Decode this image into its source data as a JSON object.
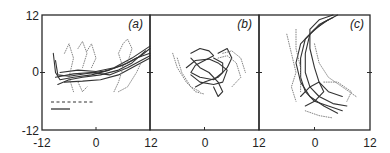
{
  "chart_data": [
    {
      "type": "line",
      "panel_label": "(a)",
      "xlim": [
        -12,
        12
      ],
      "ylim": [
        -12,
        12
      ],
      "x_ticks": [
        "-12",
        "0",
        "12"
      ],
      "y_ticks": [
        "12",
        "0",
        "-12"
      ],
      "legend": [
        {
          "style": "dashed",
          "label": ""
        },
        {
          "style": "solid",
          "label": ""
        }
      ],
      "series": [
        {
          "name": "solid trajectories",
          "style": "solid",
          "paths": [
            [
              [
                -9.5,
                4
              ],
              [
                -9,
                0
              ],
              [
                -8,
                -1.5
              ],
              [
                -5,
                -1
              ],
              [
                -1,
                -0.5
              ],
              [
                3,
                0.5
              ],
              [
                7,
                2
              ],
              [
                10,
                3.5
              ],
              [
                12,
                5
              ]
            ],
            [
              [
                -9,
                2.5
              ],
              [
                -8.5,
                -0.5
              ],
              [
                -6,
                -0.8
              ],
              [
                -2,
                -0.2
              ],
              [
                2,
                0.3
              ],
              [
                6,
                1.5
              ],
              [
                9,
                3
              ],
              [
                12,
                4
              ]
            ],
            [
              [
                -8.5,
                -2.5
              ],
              [
                -6,
                -1.5
              ],
              [
                -3,
                -1
              ],
              [
                1,
                -0.5
              ],
              [
                5,
                0.5
              ],
              [
                8,
                2
              ],
              [
                11,
                4.5
              ]
            ],
            [
              [
                -8,
                0
              ],
              [
                -4,
                0.5
              ],
              [
                0,
                0.2
              ],
              [
                4,
                1
              ],
              [
                8,
                3
              ],
              [
                12,
                5.5
              ]
            ],
            [
              [
                -9,
                -1
              ],
              [
                -5,
                -0.3
              ],
              [
                -1,
                0
              ],
              [
                3,
                -0.5
              ],
              [
                7,
                1
              ],
              [
                10,
                2.5
              ],
              [
                12,
                3.5
              ]
            ],
            [
              [
                -7,
                -2
              ],
              [
                -3,
                -1.8
              ],
              [
                1,
                -1.5
              ],
              [
                5,
                -0.5
              ],
              [
                9,
                1.5
              ],
              [
                12,
                3
              ]
            ]
          ]
        },
        {
          "name": "dotted trajectories",
          "style": "dotted",
          "paths": [
            [
              [
                -7,
                4
              ],
              [
                -6,
                6
              ],
              [
                -5,
                3
              ],
              [
                -6,
                -1
              ],
              [
                -5,
                -4
              ]
            ],
            [
              [
                -4,
                5
              ],
              [
                -3,
                6.5
              ],
              [
                -2,
                4
              ],
              [
                -3,
                1
              ]
            ],
            [
              [
                -2,
                4.5
              ],
              [
                -1,
                6
              ],
              [
                0,
                3
              ],
              [
                -1,
                1
              ]
            ],
            [
              [
                -4,
                -2
              ],
              [
                -3,
                -4
              ],
              [
                -2,
                -3
              ]
            ],
            [
              [
                4,
                -4
              ],
              [
                5,
                -2
              ],
              [
                6,
                1
              ],
              [
                5,
                4
              ],
              [
                6,
                6
              ],
              [
                7,
                7
              ],
              [
                8,
                5
              ],
              [
                7,
                2
              ]
            ],
            [
              [
                5,
                -4
              ],
              [
                7,
                -3
              ],
              [
                9,
                0
              ],
              [
                10,
                2
              ]
            ]
          ]
        }
      ]
    },
    {
      "type": "line",
      "panel_label": "(b)",
      "xlim": [
        -12,
        12
      ],
      "ylim": [
        -12,
        12
      ],
      "x_ticks": [
        "0",
        "12"
      ],
      "series": [
        {
          "name": "solid trajectories",
          "style": "solid",
          "paths": [
            [
              [
                -3,
                4
              ],
              [
                -1,
                5
              ],
              [
                1,
                4.5
              ],
              [
                2,
                3.5
              ],
              [
                0,
                2.5
              ],
              [
                -2,
                1.5
              ],
              [
                -3,
                0
              ],
              [
                -1,
                -1
              ],
              [
                2,
                -1.5
              ],
              [
                4,
                0
              ],
              [
                4,
                2
              ],
              [
                2,
                3
              ]
            ],
            [
              [
                -4,
                1
              ],
              [
                -2,
                2.5
              ],
              [
                1,
                2.8
              ],
              [
                3,
                2
              ],
              [
                5,
                0.5
              ],
              [
                4,
                -2
              ],
              [
                2,
                -2.5
              ],
              [
                -1,
                -2
              ],
              [
                -3,
                -0.5
              ]
            ],
            [
              [
                -2,
                -3
              ],
              [
                0,
                -2
              ],
              [
                3,
                -1
              ],
              [
                5,
                1
              ],
              [
                6,
                3
              ],
              [
                5,
                5
              ],
              [
                3,
                4
              ]
            ],
            [
              [
                -3,
                3
              ],
              [
                -1,
                1
              ],
              [
                1,
                0
              ],
              [
                3,
                -2
              ],
              [
                4,
                -4
              ],
              [
                3,
                -5
              ],
              [
                2,
                -3
              ]
            ]
          ]
        },
        {
          "name": "dotted trajectories",
          "style": "dotted",
          "paths": [
            [
              [
                -7,
                4
              ],
              [
                -6,
                1
              ],
              [
                -4,
                -2
              ],
              [
                -2,
                -4
              ],
              [
                0,
                -4.5
              ]
            ],
            [
              [
                -6,
                3
              ],
              [
                -5,
                0
              ],
              [
                -3,
                -3
              ],
              [
                -1,
                -4
              ]
            ],
            [
              [
                3,
                3
              ],
              [
                5,
                3.5
              ],
              [
                7,
                2
              ],
              [
                8,
                -1
              ],
              [
                6,
                -3
              ]
            ],
            [
              [
                4,
                4
              ],
              [
                6,
                4.5
              ],
              [
                8,
                3
              ],
              [
                9,
                0
              ]
            ]
          ]
        }
      ]
    },
    {
      "type": "line",
      "panel_label": "(c)",
      "xlim": [
        -12,
        12
      ],
      "ylim": [
        -12,
        12
      ],
      "x_ticks": [
        "0",
        "12"
      ],
      "series": [
        {
          "name": "solid trajectories",
          "style": "solid",
          "paths": [
            [
              [
                4,
                11.5
              ],
              [
                1,
                10
              ],
              [
                -2,
                7
              ],
              [
                -3,
                3
              ],
              [
                -3,
                -1
              ],
              [
                -2,
                -4
              ],
              [
                0,
                -6
              ],
              [
                3,
                -7
              ],
              [
                6,
                -8
              ]
            ],
            [
              [
                5,
                12
              ],
              [
                2,
                10.5
              ],
              [
                -1,
                8
              ],
              [
                -2,
                4
              ],
              [
                -2,
                0
              ],
              [
                -1,
                -3
              ],
              [
                1,
                -5
              ],
              [
                4,
                -6.5
              ],
              [
                7,
                -7
              ]
            ],
            [
              [
                3,
                11
              ],
              [
                0,
                9
              ],
              [
                -3,
                6
              ],
              [
                -4,
                2
              ],
              [
                -3,
                -2
              ],
              [
                -1,
                -5
              ],
              [
                2,
                -7
              ],
              [
                5,
                -8.5
              ]
            ],
            [
              [
                4,
                12
              ],
              [
                1,
                11
              ],
              [
                -1,
                9
              ],
              [
                -1,
                5
              ],
              [
                0,
                1
              ],
              [
                1,
                -2
              ],
              [
                3,
                -4
              ],
              [
                6,
                -5
              ]
            ],
            [
              [
                -3,
                -5
              ],
              [
                -1,
                -3
              ],
              [
                1,
                -2
              ],
              [
                2,
                -4
              ],
              [
                0,
                -6
              ],
              [
                -2,
                -7
              ]
            ]
          ]
        },
        {
          "name": "dotted trajectories",
          "style": "dotted",
          "paths": [
            [
              [
                -6,
                8
              ],
              [
                -5,
                4
              ],
              [
                -4,
                0
              ],
              [
                -5,
                -3
              ],
              [
                -4,
                -6
              ]
            ],
            [
              [
                -4,
                9
              ],
              [
                -4,
                5
              ],
              [
                -3,
                1
              ],
              [
                -3,
                -4
              ]
            ],
            [
              [
                0,
                6
              ],
              [
                1,
                2
              ],
              [
                3,
                -1
              ],
              [
                6,
                -3
              ],
              [
                9,
                -5
              ]
            ],
            [
              [
                2,
                -2
              ],
              [
                5,
                -2
              ],
              [
                8,
                -4
              ],
              [
                7,
                -6
              ]
            ],
            [
              [
                -2,
                -8
              ],
              [
                1,
                -9
              ],
              [
                4,
                -9.5
              ]
            ]
          ]
        }
      ]
    }
  ],
  "axes": {
    "y_tick_labels": {
      "top": "12",
      "mid": "0",
      "bottom": "-12"
    },
    "x_tick_labels": [
      "-12",
      "0",
      "12",
      "0",
      "12",
      "0",
      "12"
    ]
  },
  "colors": {
    "axis": "#2a2a2a",
    "solid_line": "#333333",
    "dotted_line": "#777777",
    "background": "#ffffff"
  }
}
